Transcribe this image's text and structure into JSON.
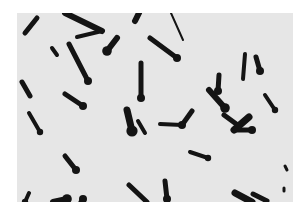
{
  "image": {
    "subject": "micrograph of rod-shaped bacteria with terminal spores",
    "background_color": "#e6e6e6",
    "frame_color": "#ffffff",
    "cell_color": "#141414",
    "panel": {
      "x": 17,
      "y": 13,
      "width": 276,
      "height": 189
    },
    "rods": [
      {
        "x1": 20,
        "y1": 5,
        "x2": 8,
        "y2": 20,
        "w": 5,
        "spore": false
      },
      {
        "x1": 48,
        "y1": 0,
        "x2": 85,
        "y2": 18,
        "w": 6,
        "spore": false
      },
      {
        "x1": 85,
        "y1": 18,
        "x2": 60,
        "y2": 24,
        "w": 4,
        "spore": false
      },
      {
        "x1": 35,
        "y1": 35,
        "x2": 40,
        "y2": 42,
        "w": 4,
        "spore": false
      },
      {
        "x1": 52,
        "y1": 31,
        "x2": 71,
        "y2": 68,
        "w": 5,
        "spore": true
      },
      {
        "x1": 100,
        "y1": 25,
        "x2": 90,
        "y2": 38,
        "w": 6,
        "spore": true
      },
      {
        "x1": 122,
        "y1": 0,
        "x2": 118,
        "y2": 8,
        "w": 6,
        "spore": false
      },
      {
        "x1": 154,
        "y1": 0,
        "x2": 166,
        "y2": 27,
        "w": 2,
        "spore": false
      },
      {
        "x1": 133,
        "y1": 25,
        "x2": 160,
        "y2": 45,
        "w": 5,
        "spore": true
      },
      {
        "x1": 124,
        "y1": 50,
        "x2": 124,
        "y2": 85,
        "w": 5,
        "spore": true
      },
      {
        "x1": 228,
        "y1": 41,
        "x2": 226,
        "y2": 66,
        "w": 4,
        "spore": false
      },
      {
        "x1": 239,
        "y1": 44,
        "x2": 243,
        "y2": 58,
        "w": 5,
        "spore": true
      },
      {
        "x1": 202,
        "y1": 62,
        "x2": 201,
        "y2": 78,
        "w": 5,
        "spore": true
      },
      {
        "x1": 5,
        "y1": 69,
        "x2": 13,
        "y2": 83,
        "w": 5,
        "spore": false
      },
      {
        "x1": 48,
        "y1": 81,
        "x2": 66,
        "y2": 93,
        "w": 5,
        "spore": true
      },
      {
        "x1": 192,
        "y1": 77,
        "x2": 208,
        "y2": 95,
        "w": 6,
        "spore": true
      },
      {
        "x1": 248,
        "y1": 82,
        "x2": 258,
        "y2": 97,
        "w": 4,
        "spore": true
      },
      {
        "x1": 12,
        "y1": 100,
        "x2": 23,
        "y2": 119,
        "w": 4,
        "spore": true
      },
      {
        "x1": 110,
        "y1": 97,
        "x2": 115,
        "y2": 118,
        "w": 7,
        "spore": true
      },
      {
        "x1": 121,
        "y1": 108,
        "x2": 128,
        "y2": 120,
        "w": 4,
        "spore": false
      },
      {
        "x1": 143,
        "y1": 111,
        "x2": 165,
        "y2": 112,
        "w": 4,
        "spore": false
      },
      {
        "x1": 175,
        "y1": 98,
        "x2": 165,
        "y2": 112,
        "w": 5,
        "spore": true
      },
      {
        "x1": 207,
        "y1": 102,
        "x2": 222,
        "y2": 113,
        "w": 5,
        "spore": false
      },
      {
        "x1": 232,
        "y1": 104,
        "x2": 217,
        "y2": 117,
        "w": 7,
        "spore": false
      },
      {
        "x1": 218,
        "y1": 117,
        "x2": 235,
        "y2": 117,
        "w": 5,
        "spore": true
      },
      {
        "x1": 48,
        "y1": 143,
        "x2": 59,
        "y2": 157,
        "w": 5,
        "spore": true
      },
      {
        "x1": 173,
        "y1": 139,
        "x2": 191,
        "y2": 145,
        "w": 4,
        "spore": true
      },
      {
        "x1": 148,
        "y1": 168,
        "x2": 150,
        "y2": 186,
        "w": 5,
        "spore": true
      },
      {
        "x1": 12,
        "y1": 180,
        "x2": 8,
        "y2": 189,
        "w": 4,
        "spore": true
      },
      {
        "x1": 36,
        "y1": 189,
        "x2": 50,
        "y2": 186,
        "w": 6,
        "spore": true
      },
      {
        "x1": 64,
        "y1": 189,
        "x2": 66,
        "y2": 186,
        "w": 5,
        "spore": true
      },
      {
        "x1": 112,
        "y1": 172,
        "x2": 130,
        "y2": 189,
        "w": 5,
        "spore": false
      },
      {
        "x1": 218,
        "y1": 180,
        "x2": 235,
        "y2": 189,
        "w": 7,
        "spore": false
      },
      {
        "x1": 236,
        "y1": 181,
        "x2": 250,
        "y2": 188,
        "w": 5,
        "spore": false
      },
      {
        "x1": 268,
        "y1": 153,
        "x2": 270,
        "y2": 157,
        "w": 3,
        "spore": false
      },
      {
        "x1": 267,
        "y1": 175,
        "x2": 267,
        "y2": 178,
        "w": 3,
        "spore": false
      }
    ]
  }
}
